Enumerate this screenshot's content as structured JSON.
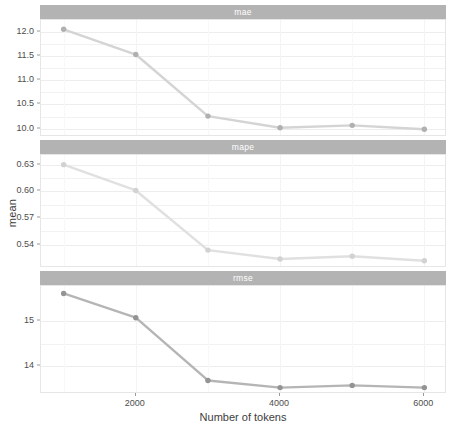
{
  "chart_data": {
    "type": "line",
    "title": "",
    "subtitle": "",
    "xlabel": "Number of tokens",
    "ylabel": "mean",
    "grid": true,
    "legend": "none",
    "facet_direction": "vertical",
    "x": [
      1000,
      2000,
      3000,
      4000,
      5000,
      6000
    ],
    "xlim": [
      700,
      6300
    ],
    "xticks": [
      2000,
      4000,
      6000
    ],
    "xtick_labels": [
      "2000",
      "4000",
      "6000"
    ],
    "facets": [
      {
        "name": "mae",
        "strip_label": "mae",
        "color": "#d4d4d4",
        "point_color": "#b0b0b0",
        "values": [
          12.05,
          11.53,
          10.26,
          10.02,
          10.07,
          9.99
        ],
        "ylim": [
          9.85,
          12.18
        ],
        "yticks": [
          10.0,
          10.5,
          11.0,
          11.5,
          12.0
        ],
        "ytick_labels": [
          "10.0",
          "10.5",
          "11.0",
          "11.5",
          "12.0"
        ]
      },
      {
        "name": "mape",
        "strip_label": "mape",
        "color": "#e0e0e0",
        "point_color": "#d2d2d2",
        "values": [
          0.63,
          0.601,
          0.534,
          0.524,
          0.527,
          0.522
        ],
        "ylim": [
          0.515,
          0.6375
        ],
        "yticks": [
          0.54,
          0.57,
          0.6,
          0.63
        ],
        "ytick_labels": [
          "0.54",
          "0.57",
          "0.60",
          "0.63"
        ]
      },
      {
        "name": "rmse",
        "strip_label": "rmse",
        "color": "#b5b5b5",
        "point_color": "#949494",
        "values": [
          15.62,
          15.08,
          13.68,
          13.52,
          13.57,
          13.52
        ],
        "ylim": [
          13.4,
          15.72
        ],
        "yticks": [
          14,
          15
        ],
        "ytick_labels": [
          "14",
          "15"
        ]
      }
    ]
  },
  "theme": {
    "strip_background": "#b3b3b3",
    "strip_text_color": "#ffffff",
    "panel_background": "#ffffff",
    "gridline_color": "#f0f0f0",
    "axis_text_color": "#4d4d4d"
  }
}
